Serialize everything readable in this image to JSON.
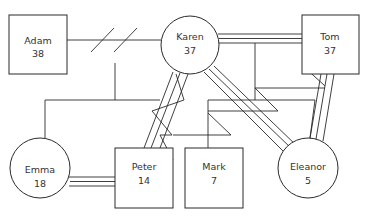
{
  "diagram": {
    "type": "genogram",
    "nodes": [
      {
        "id": "adam",
        "name": "Adam",
        "age": "38",
        "shape": "square",
        "x": 9,
        "y": 15,
        "w": 58,
        "h": 59
      },
      {
        "id": "karen",
        "name": "Karen",
        "age": "37",
        "shape": "circle",
        "cx": 190,
        "cy": 45,
        "r": 29
      },
      {
        "id": "tom",
        "name": "Tom",
        "age": "37",
        "shape": "square",
        "x": 302,
        "y": 15,
        "w": 57,
        "h": 59
      },
      {
        "id": "emma",
        "name": "Emma",
        "age": "18",
        "shape": "circle",
        "cx": 40,
        "cy": 168,
        "r": 30
      },
      {
        "id": "peter",
        "name": "Peter",
        "age": "14",
        "shape": "square",
        "x": 115,
        "y": 148,
        "w": 58,
        "h": 60
      },
      {
        "id": "mark",
        "name": "Mark",
        "age": "7",
        "shape": "square",
        "x": 185,
        "y": 148,
        "w": 58,
        "h": 60
      },
      {
        "id": "eleanor",
        "name": "Eleanor",
        "age": "5",
        "shape": "circle",
        "cx": 308,
        "cy": 168,
        "r": 30
      }
    ],
    "relationships": [
      {
        "from": "Adam",
        "to": "Karen",
        "type": "divorced"
      },
      {
        "from": "Karen",
        "to": "Tom",
        "type": "very close"
      },
      {
        "from": "Karen",
        "to": "Peter",
        "type": "conflictual close"
      },
      {
        "from": "Karen",
        "to": "Eleanor",
        "type": "very close"
      },
      {
        "from": "Tom",
        "to": "Eleanor",
        "type": "very close"
      },
      {
        "from": "Emma",
        "to": "Peter",
        "type": "very close"
      },
      {
        "from": "Tom",
        "to": "Mark",
        "type": "conflictual"
      },
      {
        "from": "Tom",
        "to": "Peter",
        "type": "conflictual"
      }
    ],
    "colors": {
      "line": "#2a2a2a",
      "fill": "#ffffff",
      "text": "#333333"
    }
  }
}
